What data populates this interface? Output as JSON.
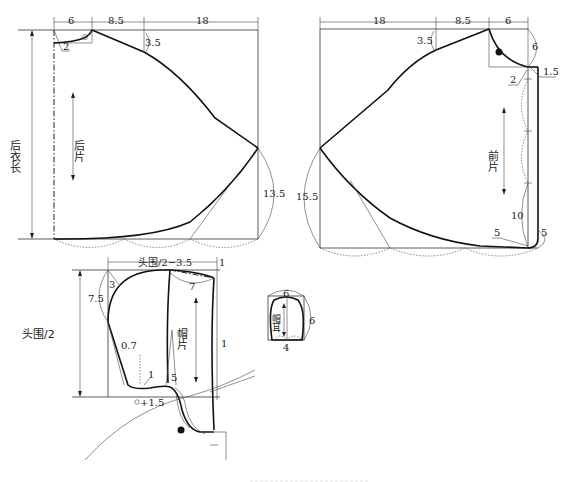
{
  "diagram": {
    "back_piece": {
      "name_label": "后片",
      "length_label": "后衣长",
      "dims": {
        "neck_width": "6",
        "shoulder_drop_w": "8.5",
        "body_width": "18",
        "shoulder_drop": "3.5",
        "neck_depth": "2",
        "side_length": "13.5"
      }
    },
    "front_piece": {
      "name_label": "前片",
      "dims": {
        "body_width": "18",
        "shoulder_w": "8.5",
        "neck_width": "6",
        "neck_depth": "6",
        "shoulder_drop": "3.5",
        "placket_ext": "1.5",
        "neck_offset": "2",
        "side_length": "15.5",
        "hem_curve": "10",
        "hem_round_a": "5",
        "hem_round_b": "5"
      }
    },
    "hood_piece": {
      "name_label": "帽片",
      "dims": {
        "width": "头围/2−3.5",
        "height": "头围/2",
        "top_offset": "1",
        "front_curve": "7",
        "back_curve": "7.5",
        "corner": "3",
        "dart_left": "0.7",
        "front_edge": "1",
        "dart_mark": "1",
        "dart_len": "5",
        "bottom_ext": "+1.5"
      }
    },
    "hood_ear": {
      "name_label": "帽耳",
      "dims": {
        "top": "6",
        "side": "6",
        "bottom": "4"
      }
    }
  }
}
